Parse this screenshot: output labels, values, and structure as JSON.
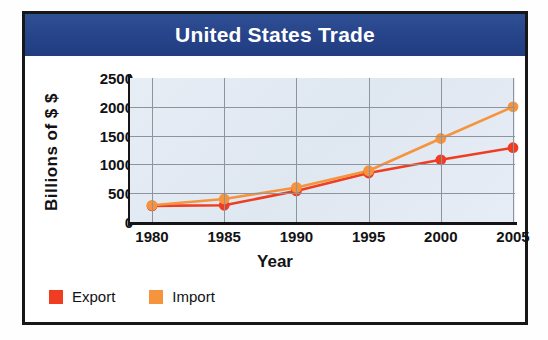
{
  "figure": {
    "title": "United States Trade",
    "title_bg": "#2a4a8c",
    "border_color": "#17171a"
  },
  "chart_data": {
    "type": "line",
    "title": "United States Trade",
    "xlabel": "Year",
    "ylabel": "Billions of $ $",
    "categories": [
      "1980",
      "1985",
      "1990",
      "1995",
      "2000",
      "2005"
    ],
    "x": [
      1980,
      1985,
      1990,
      1995,
      2000,
      2005
    ],
    "series": [
      {
        "name": "Export",
        "color": "#f03c20",
        "values": [
          280,
          290,
          540,
          850,
          1080,
          1290
        ]
      },
      {
        "name": "Import",
        "color": "#f5943c",
        "values": [
          290,
          400,
          600,
          890,
          1450,
          2000
        ]
      }
    ],
    "ylim": [
      0,
      2500
    ],
    "yticks": [
      "2500",
      "2000",
      "1500",
      "1000",
      "500",
      "0"
    ],
    "ytick_values": [
      2500,
      2000,
      1500,
      1000,
      500,
      0
    ],
    "xticks": [
      "1980",
      "1985",
      "1990",
      "1995",
      "2000",
      "2005"
    ],
    "grid": true,
    "legend_position": "bottom-left",
    "plot_bg": "#e3eaf3",
    "grid_color": "#8e949e"
  },
  "legend": {
    "items": [
      {
        "label": "Export",
        "color": "#f03c20"
      },
      {
        "label": "Import",
        "color": "#f5943c"
      }
    ]
  }
}
